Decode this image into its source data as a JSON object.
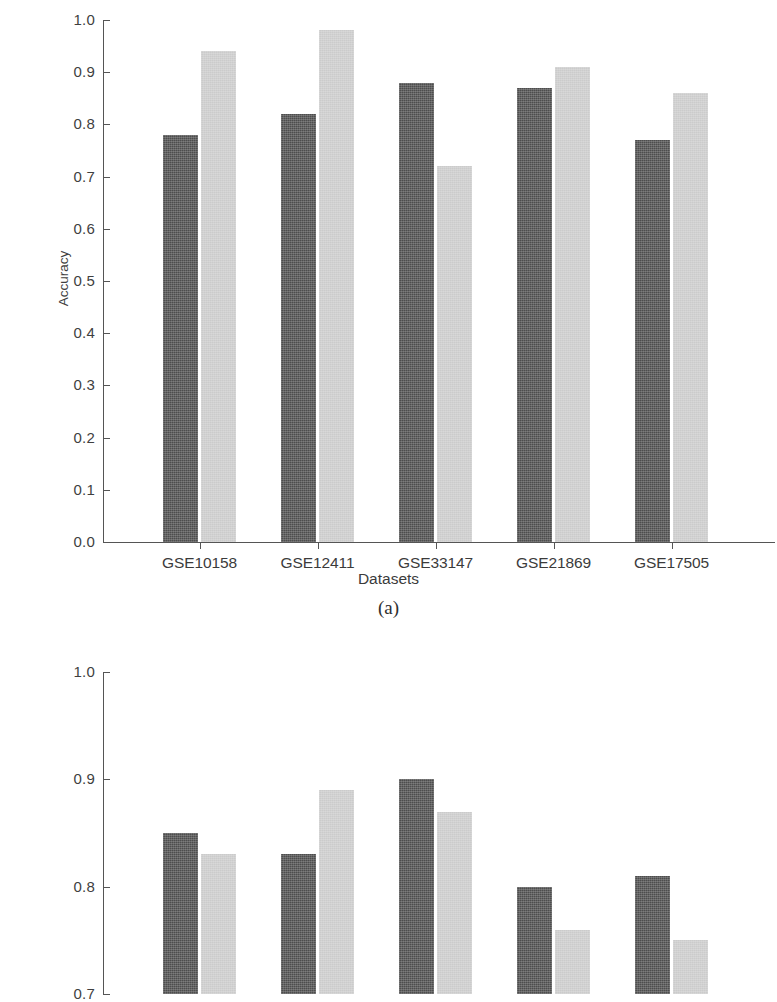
{
  "figure": {
    "panel_a_caption": "(a)",
    "panel_b_caption": ""
  },
  "chart_data": [
    {
      "id": "panel-a",
      "type": "bar",
      "title": "",
      "xlabel": "Datasets",
      "ylabel": "Accuracy",
      "ylim": [
        0.0,
        1.0
      ],
      "yticks": [
        "0.0",
        "0.1",
        "0.2",
        "0.3",
        "0.4",
        "0.5",
        "0.6",
        "0.7",
        "0.8",
        "0.9",
        "1.0"
      ],
      "ytick_values": [
        0.0,
        0.1,
        0.2,
        0.3,
        0.4,
        0.5,
        0.6,
        0.7,
        0.8,
        0.9,
        1.0
      ],
      "grid": false,
      "legend": "none",
      "categories": [
        "GSE10158",
        "GSE12411",
        "GSE33147",
        "GSE21869",
        "GSE17505"
      ],
      "series": [
        {
          "name": "series-dark",
          "color": "#4d4d4d",
          "values": [
            0.78,
            0.82,
            0.88,
            0.87,
            0.77
          ]
        },
        {
          "name": "series-light",
          "color": "#cbcbcb",
          "values": [
            0.94,
            0.98,
            0.72,
            0.91,
            0.86
          ]
        }
      ]
    },
    {
      "id": "panel-b",
      "type": "bar",
      "title": "",
      "xlabel": "",
      "ylabel": "",
      "ylim": [
        0.7,
        1.0
      ],
      "yticks": [
        "0.7",
        "0.8",
        "0.9",
        "1.0"
      ],
      "ytick_values": [
        0.7,
        0.8,
        0.9,
        1.0
      ],
      "grid": false,
      "legend": "none",
      "note": "panel cropped at image bottom edge",
      "categories": [
        "",
        "",
        "",
        "",
        ""
      ],
      "series": [
        {
          "name": "series-dark",
          "color": "#4d4d4d",
          "values": [
            0.85,
            0.83,
            0.9,
            0.8,
            0.81
          ]
        },
        {
          "name": "series-light",
          "color": "#cbcbcb",
          "values": [
            0.83,
            0.89,
            0.87,
            0.76,
            0.75
          ]
        }
      ]
    }
  ]
}
